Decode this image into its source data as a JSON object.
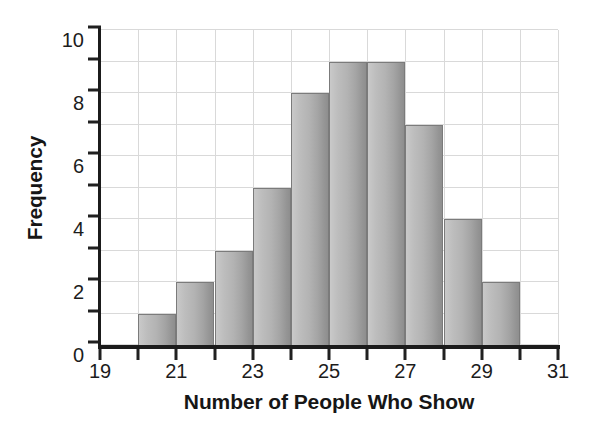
{
  "chart_data": {
    "type": "bar",
    "title": "",
    "subtitle": "",
    "xlabel": "Number of People Who Show",
    "ylabel": "Frequency",
    "xlim": [
      19,
      31
    ],
    "ylim": [
      0,
      10
    ],
    "grid": true,
    "legend": false,
    "legend_position": "none",
    "bin_width": 1,
    "x_tick_values": [
      19,
      20,
      21,
      22,
      23,
      24,
      25,
      26,
      27,
      28,
      29,
      30,
      31
    ],
    "x_tick_labels": [
      "19",
      "",
      "21",
      "",
      "23",
      "",
      "25",
      "",
      "27",
      "",
      "29",
      "",
      "31"
    ],
    "x_labeled_ticks": [
      "19",
      "21",
      "23",
      "25",
      "27",
      "29",
      "31"
    ],
    "y_tick_values": [
      0,
      1,
      2,
      3,
      4,
      5,
      6,
      7,
      8,
      9,
      10
    ],
    "y_tick_labels": [
      "0",
      "",
      "2",
      "",
      "4",
      "",
      "6",
      "",
      "8",
      "",
      "10"
    ],
    "y_labeled_ticks": [
      "0",
      "2",
      "4",
      "6",
      "8",
      "10"
    ],
    "categories": [
      19,
      20,
      21,
      22,
      23,
      24,
      25,
      26,
      27,
      28,
      29,
      30
    ],
    "values": [
      0,
      1,
      2,
      3,
      5,
      8,
      9,
      9,
      7,
      4,
      2,
      0
    ],
    "bins": [
      {
        "start": 19,
        "end": 20,
        "frequency": 0
      },
      {
        "start": 20,
        "end": 21,
        "frequency": 1
      },
      {
        "start": 21,
        "end": 22,
        "frequency": 2
      },
      {
        "start": 22,
        "end": 23,
        "frequency": 3
      },
      {
        "start": 23,
        "end": 24,
        "frequency": 5
      },
      {
        "start": 24,
        "end": 25,
        "frequency": 8
      },
      {
        "start": 25,
        "end": 26,
        "frequency": 9
      },
      {
        "start": 26,
        "end": 27,
        "frequency": 9
      },
      {
        "start": 27,
        "end": 28,
        "frequency": 7
      },
      {
        "start": 28,
        "end": 29,
        "frequency": 4
      },
      {
        "start": 29,
        "end": 30,
        "frequency": 2
      },
      {
        "start": 30,
        "end": 31,
        "frequency": 0
      }
    ],
    "total_frequency": 50
  },
  "colors": {
    "background": "#ffffff",
    "bar_fill_light": "#c9c9c9",
    "bar_fill_dark": "#8e8e8e",
    "bar_outline": "#7b7b7b",
    "gridline": "#d9d9d9",
    "axis": "#1b1b1b",
    "text": "#1c1c1c"
  }
}
